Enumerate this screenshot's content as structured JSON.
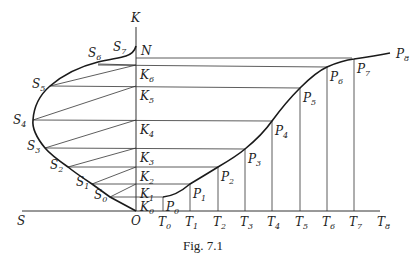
{
  "figure": {
    "caption": "Fig. 7.1",
    "axis_labels": {
      "vertical": "K",
      "horizontal_left": "S",
      "origin": "O",
      "top": "N"
    },
    "colors": {
      "line": "#333333",
      "curve": "#1a1a1a",
      "background": "#ffffff"
    },
    "origin": {
      "x": 136,
      "y": 211
    },
    "k_levels": [
      {
        "name": "K",
        "sub": "0",
        "y": 197
      },
      {
        "name": "K",
        "sub": "1",
        "y": 184
      },
      {
        "name": "K",
        "sub": "2",
        "y": 167
      },
      {
        "name": "K",
        "sub": "3",
        "y": 148
      },
      {
        "name": "K",
        "sub": "4",
        "y": 120
      },
      {
        "name": "K",
        "sub": "5",
        "y": 86
      },
      {
        "name": "K",
        "sub": "6",
        "y": 65
      }
    ],
    "s_points": [
      {
        "name": "S",
        "sub": "0",
        "x": 110,
        "y": 197
      },
      {
        "name": "S",
        "sub": "1",
        "x": 92,
        "y": 184
      },
      {
        "name": "S",
        "sub": "2",
        "x": 68,
        "y": 167
      },
      {
        "name": "S",
        "sub": "3",
        "x": 45,
        "y": 148
      },
      {
        "name": "S",
        "sub": "4",
        "x": 33,
        "y": 120
      },
      {
        "name": "S",
        "sub": "5",
        "x": 50,
        "y": 86
      },
      {
        "name": "S",
        "sub": "6",
        "x": 98,
        "y": 62
      },
      {
        "name": "S",
        "sub": "7",
        "x": 125,
        "y": 56
      }
    ],
    "p_points": [
      {
        "name": "P",
        "sub": "0",
        "x": 163,
        "y": 197
      },
      {
        "name": "P",
        "sub": "1",
        "x": 190,
        "y": 184
      },
      {
        "name": "P",
        "sub": "2",
        "x": 218,
        "y": 167
      },
      {
        "name": "P",
        "sub": "3",
        "x": 245,
        "y": 149
      },
      {
        "name": "P",
        "sub": "4",
        "x": 272,
        "y": 121
      },
      {
        "name": "P",
        "sub": "5",
        "x": 300,
        "y": 88
      },
      {
        "name": "P",
        "sub": "6",
        "x": 327,
        "y": 67
      },
      {
        "name": "P",
        "sub": "7",
        "x": 354,
        "y": 59
      },
      {
        "name": "P",
        "sub": "8",
        "x": 390,
        "y": 53
      }
    ],
    "t_ticks": [
      {
        "name": "T",
        "sub": "0",
        "x": 163
      },
      {
        "name": "T",
        "sub": "1",
        "x": 190
      },
      {
        "name": "T",
        "sub": "2",
        "x": 218
      },
      {
        "name": "T",
        "sub": "3",
        "x": 245
      },
      {
        "name": "T",
        "sub": "4",
        "x": 272
      },
      {
        "name": "T",
        "sub": "5",
        "x": 300
      },
      {
        "name": "T",
        "sub": "6",
        "x": 327
      },
      {
        "name": "T",
        "sub": "7",
        "x": 354
      },
      {
        "name": "T",
        "sub": "8",
        "x": 382
      }
    ],
    "n_level_y": 58
  }
}
